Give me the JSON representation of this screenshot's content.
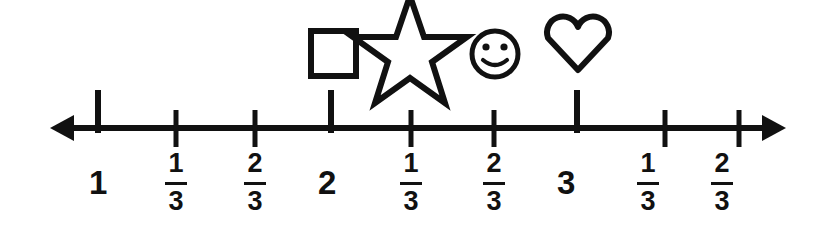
{
  "figure": {
    "type": "number-line",
    "title": "",
    "axis": {
      "line_color": "#111111",
      "left_arrow": "arrow-left",
      "right_arrow": "arrow-right",
      "left_arrow_tip_x": 50,
      "right_arrow_tip_x": 786,
      "axis_y": 128
    },
    "ticks": [
      {
        "id": "tick-1",
        "value": "1",
        "kind": "whole",
        "x": 98,
        "label_type": "whole",
        "whole": "1"
      },
      {
        "id": "tick-1-1-3",
        "value": "1 1/3",
        "kind": "fraction",
        "x": 176,
        "label_type": "fraction",
        "numerator": "1",
        "denominator": "3"
      },
      {
        "id": "tick-1-2-3",
        "value": "1 2/3",
        "kind": "fraction",
        "x": 255,
        "label_type": "fraction",
        "numerator": "2",
        "denominator": "3"
      },
      {
        "id": "tick-2",
        "value": "2",
        "kind": "whole",
        "x": 331,
        "label_type": "whole",
        "whole": "2"
      },
      {
        "id": "tick-2-1-3",
        "value": "2 1/3",
        "kind": "fraction",
        "x": 411,
        "label_type": "fraction",
        "numerator": "1",
        "denominator": "3"
      },
      {
        "id": "tick-2-2-3",
        "value": "2 2/3",
        "kind": "fraction",
        "x": 494,
        "label_type": "fraction",
        "numerator": "2",
        "denominator": "3"
      },
      {
        "id": "tick-3",
        "value": "3",
        "kind": "whole",
        "x": 577,
        "label_type": "whole",
        "whole": "3"
      },
      {
        "id": "tick-3-1-3",
        "value": "3 1/3",
        "kind": "fraction",
        "x": 665,
        "label_type": "fraction",
        "numerator": "1",
        "denominator": "3"
      },
      {
        "id": "tick-3-2-3",
        "value": "3 2/3",
        "kind": "fraction",
        "x": 739,
        "label_type": "fraction",
        "numerator": "2",
        "denominator": "3"
      }
    ],
    "markers": [
      {
        "id": "marker-square",
        "icon": "square-icon",
        "x": 333,
        "center_y": 54,
        "at_value": "2",
        "label": "square"
      },
      {
        "id": "marker-star",
        "icon": "star-icon",
        "x": 410,
        "center_y": 50,
        "at_value": "2 1/3",
        "label": "star"
      },
      {
        "id": "marker-smiley",
        "icon": "smiley-icon",
        "x": 495,
        "center_y": 54,
        "at_value": "2 2/3",
        "label": "smiley face"
      },
      {
        "id": "marker-heart",
        "icon": "heart-icon",
        "x": 578,
        "center_y": 46,
        "at_value": "3",
        "label": "heart"
      }
    ],
    "labels": {
      "whole_1": "1",
      "whole_2": "2",
      "whole_3": "3",
      "frac_1_3_num": "1",
      "frac_2_3_num": "2",
      "frac_den": "3"
    },
    "colors": {
      "ink": "#111111",
      "background": "#ffffff"
    }
  }
}
